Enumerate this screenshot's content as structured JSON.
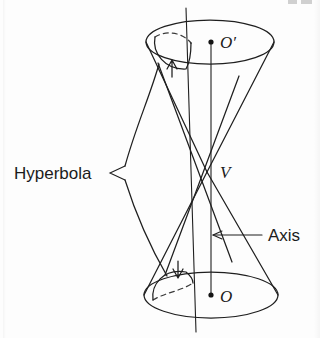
{
  "figure": {
    "background_color": "#fdfdfd",
    "ink_color": "#1f1f1f",
    "width": 320,
    "height": 338
  },
  "labels": {
    "hyperbola": "Hyperbola",
    "axis": "Axis",
    "vertex": "V",
    "apex_upper": "O′",
    "apex_lower": "O"
  },
  "geometry": {
    "upper_circle": {
      "cx": 210,
      "cy": 42,
      "rx": 64,
      "ry": 22
    },
    "lower_circle": {
      "cx": 211,
      "cy": 295,
      "rx": 67,
      "ry": 23
    },
    "vertex_point": {
      "x": 207,
      "y": 172
    },
    "axis_line": {
      "x1": 211,
      "y1": 42,
      "x2": 211,
      "y2": 295
    },
    "cutting_plane_line": {
      "x1": 186,
      "y1": 8,
      "x2": 196,
      "y2": 332
    },
    "center_dot_upper": {
      "x": 211,
      "y": 42
    },
    "center_dot_lower": {
      "x": 211,
      "y": 295
    }
  },
  "annotations": {
    "hyperbola_leader": "fork-pointer",
    "axis_leader": "left-arrow",
    "section_arrow_upper": "up-arrow",
    "section_arrow_lower": "down-arrow"
  }
}
